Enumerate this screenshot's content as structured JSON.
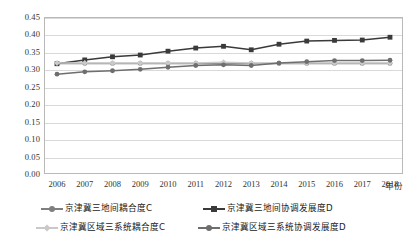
{
  "chart_data": {
    "type": "line",
    "title": "",
    "xlabel": "年份",
    "ylabel": "",
    "x": [
      2006,
      2007,
      2008,
      2009,
      2010,
      2011,
      2012,
      2013,
      2014,
      2015,
      2016,
      2017,
      2018
    ],
    "categories": [
      "2006",
      "2007",
      "2008",
      "2009",
      "2010",
      "2011",
      "2012",
      "2013",
      "2014",
      "2015",
      "2016",
      "2017",
      "2018"
    ],
    "ylim": [
      0.0,
      0.45
    ],
    "ytick_labels": [
      "0.00",
      "0.05",
      "0.10",
      "0.15",
      "0.20",
      "0.25",
      "0.30",
      "0.35",
      "0.40",
      "0.45"
    ],
    "ytick_values": [
      0.0,
      0.05,
      0.1,
      0.15,
      0.2,
      0.25,
      0.3,
      0.35,
      0.4,
      0.45
    ],
    "grid": true,
    "legend_position": "bottom",
    "series": [
      {
        "name": "京津冀三地间耦合度C",
        "color": "#7f7f7f",
        "marker": "circle",
        "values": [
          0.317,
          0.317,
          0.317,
          0.317,
          0.317,
          0.317,
          0.317,
          0.317,
          0.317,
          0.317,
          0.317,
          0.317,
          0.317
        ]
      },
      {
        "name": "京津冀三地间协调发展度D",
        "color": "#3a3a3a",
        "marker": "square",
        "values": [
          0.316,
          0.327,
          0.336,
          0.341,
          0.352,
          0.361,
          0.366,
          0.356,
          0.372,
          0.381,
          0.383,
          0.384,
          0.392
        ]
      },
      {
        "name": "京津冀区域三系统耦合度C",
        "color": "#c9c9c9",
        "marker": "diamond",
        "values": [
          0.318,
          0.318,
          0.318,
          0.318,
          0.318,
          0.318,
          0.32,
          0.318,
          0.318,
          0.318,
          0.318,
          0.318,
          0.318
        ]
      },
      {
        "name": "京津冀区域三系统协调发展度D",
        "color": "#6e6e6e",
        "marker": "circle",
        "values": [
          0.286,
          0.293,
          0.296,
          0.3,
          0.306,
          0.311,
          0.313,
          0.311,
          0.318,
          0.322,
          0.325,
          0.325,
          0.326
        ]
      }
    ]
  },
  "axis": {
    "x_title": "年份"
  },
  "legend": {
    "items": [
      {
        "label": "京津冀三地间耦合度C"
      },
      {
        "label": "京津冀三地间协调发展度D"
      },
      {
        "label": "京津冀区域三系统耦合度C"
      },
      {
        "label": "京津冀区域三系统协调发展度D"
      }
    ]
  }
}
